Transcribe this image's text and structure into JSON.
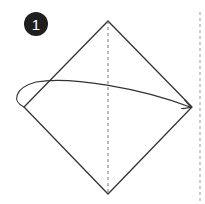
{
  "step": {
    "number": "1"
  },
  "diagram": {
    "type": "origami-fold-instruction",
    "shape": "square rotated 45 degrees (diamond)",
    "vertices": {
      "top": [
        108,
        21
      ],
      "right": [
        192,
        107
      ],
      "bottom": [
        108,
        194
      ],
      "left": [
        24,
        107
      ]
    },
    "center_crease": "vertical dashed valley line",
    "edge_guide": "vertical dashed line at right edge",
    "arrow": "curved fold arrow from left corner to right corner",
    "colors": {
      "line": "#333333",
      "dashed": "#888888",
      "badge": "#1f1f1f"
    }
  }
}
